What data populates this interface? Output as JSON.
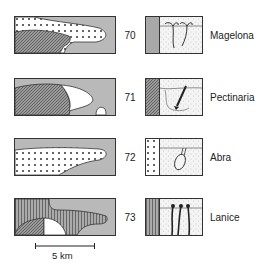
{
  "rows": [
    {
      "number": "70",
      "species": "Magelona"
    },
    {
      "number": "71",
      "species": "Pectinaria"
    },
    {
      "number": "72",
      "species": "Abra"
    },
    {
      "number": "73",
      "species": "Lanice"
    }
  ],
  "scale_bar": {
    "label": "5 km"
  },
  "colors": {
    "gray": "#b9b9b9",
    "outline": "#333333",
    "white": "#ffffff"
  }
}
